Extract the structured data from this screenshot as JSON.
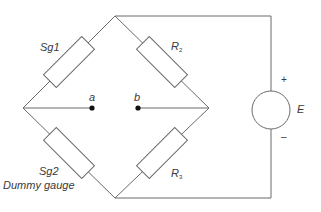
{
  "diagram": {
    "type": "Wheatstone bridge circuit",
    "labels": {
      "sg1": "Sg1",
      "sg2": "Sg2",
      "dummy": "Dummy gauge",
      "r2_main": "R",
      "r2_sub": "2",
      "r3_main": "R",
      "r3_sub": "3",
      "node_a": "a",
      "node_b": "b",
      "source": "E",
      "plus": "+",
      "minus": "–"
    },
    "colors": {
      "line": "#6b6b6b",
      "text": "#3a3a3a",
      "background": "#ffffff"
    }
  }
}
